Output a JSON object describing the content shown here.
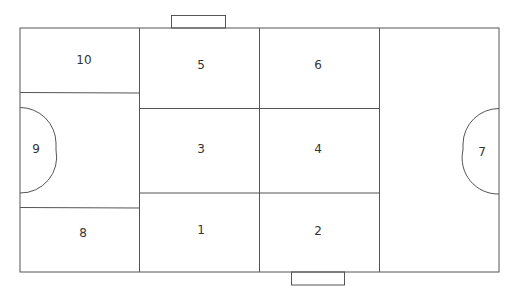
{
  "diagram": {
    "type": "field-zone-map",
    "line_color": "#555555",
    "background": "#ffffff",
    "zones": [
      {
        "id": "zone-1",
        "label": "1",
        "x": 201,
        "y": 230
      },
      {
        "id": "zone-2",
        "label": "2",
        "x": 318,
        "y": 231
      },
      {
        "id": "zone-3",
        "label": "3",
        "x": 201,
        "y": 149
      },
      {
        "id": "zone-4",
        "label": "4",
        "x": 318,
        "y": 149
      },
      {
        "id": "zone-5",
        "label": "5",
        "x": 201,
        "y": 65
      },
      {
        "id": "zone-6",
        "label": "6",
        "x": 318,
        "y": 65
      },
      {
        "id": "zone-7",
        "label": "7",
        "x": 482,
        "y": 152
      },
      {
        "id": "zone-8",
        "label": "8",
        "x": 83,
        "y": 233
      },
      {
        "id": "zone-9",
        "label": "9",
        "x": 36,
        "y": 149
      },
      {
        "id": "zone-10",
        "label": "10",
        "x": 84,
        "y": 60
      }
    ]
  }
}
